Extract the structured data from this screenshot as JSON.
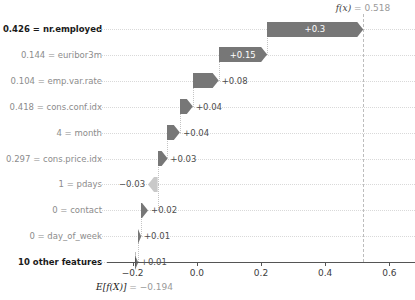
{
  "chart_data": {
    "type": "bar",
    "chart_style": "shap-waterfall",
    "title": "",
    "xlabel": "",
    "ylabel": "",
    "xlim": [
      -0.28,
      0.68
    ],
    "xticks": [
      -0.2,
      0.0,
      0.2,
      0.4,
      0.6
    ],
    "xticklabels": [
      "−0.2",
      "0.0",
      "0.2",
      "0.4",
      "0.6"
    ],
    "grid": true,
    "base_value": -0.194,
    "base_value_label": "−0.194",
    "output_value": 0.518,
    "output_value_label": "0.518",
    "base_annotation_prefix": "E[f(X)]",
    "base_annotation_eq": " = ",
    "output_annotation_prefix": "f(x)",
    "output_annotation_eq": " = ",
    "categories": [
      "0.426 = nr.employed",
      "0.144 = euribor3m",
      "0.104 = emp.var.rate",
      "0.418 = cons.conf.idx",
      "4 = month",
      "0.297 = cons.price.idx",
      "1 = pdays",
      "0 = contact",
      "0 = day_of_week",
      "10 other features"
    ],
    "values": [
      0.3,
      0.15,
      0.08,
      0.04,
      0.04,
      0.03,
      -0.03,
      0.02,
      0.01,
      0.01
    ],
    "value_labels": [
      "+0.3",
      "+0.15",
      "+0.08",
      "+0.04",
      "+0.04",
      "+0.03",
      "−0.03",
      "+0.02",
      "+0.01",
      "+0.01"
    ],
    "bars": [
      {
        "label": "0.426 = nr.employed",
        "value": 0.3,
        "value_label": "+0.3",
        "start": 0.218,
        "end": 0.518,
        "direction": "positive",
        "label_inside": true,
        "emphasis": true
      },
      {
        "label": "0.144 = euribor3m",
        "value": 0.15,
        "value_label": "+0.15",
        "start": 0.068,
        "end": 0.218,
        "direction": "positive",
        "label_inside": true,
        "emphasis": false
      },
      {
        "label": "0.104 = emp.var.rate",
        "value": 0.08,
        "value_label": "+0.08",
        "start": -0.012,
        "end": 0.068,
        "direction": "positive",
        "label_inside": false,
        "emphasis": false
      },
      {
        "label": "0.418 = cons.conf.idx",
        "value": 0.04,
        "value_label": "+0.04",
        "start": -0.052,
        "end": -0.012,
        "direction": "positive",
        "label_inside": false,
        "emphasis": false
      },
      {
        "label": "4 = month",
        "value": 0.04,
        "value_label": "+0.04",
        "start": -0.092,
        "end": -0.052,
        "direction": "positive",
        "label_inside": false,
        "emphasis": false
      },
      {
        "label": "0.297 = cons.price.idx",
        "value": 0.03,
        "value_label": "+0.03",
        "start": -0.122,
        "end": -0.092,
        "direction": "positive",
        "label_inside": false,
        "emphasis": false
      },
      {
        "label": "1 = pdays",
        "value": -0.03,
        "value_label": "−0.03",
        "start": -0.122,
        "end": -0.152,
        "direction": "negative",
        "label_inside": false,
        "emphasis": false
      },
      {
        "label": "0 = contact",
        "value": 0.02,
        "value_label": "+0.02",
        "start": -0.174,
        "end": -0.152,
        "direction": "positive",
        "label_inside": false,
        "emphasis": false
      },
      {
        "label": "0 = day_of_week",
        "value": 0.01,
        "value_label": "+0.01",
        "start": -0.184,
        "end": -0.174,
        "direction": "positive",
        "label_inside": false,
        "emphasis": false
      },
      {
        "label": "10 other features",
        "value": 0.01,
        "value_label": "+0.01",
        "start": -0.194,
        "end": -0.184,
        "direction": "positive",
        "label_inside": false,
        "emphasis": false
      }
    ],
    "colors": {
      "positive": "#777777",
      "negative": "#c9c9c9",
      "axis": "#555555",
      "grid": "#d9d9d9",
      "label": "#8c8c8c",
      "label_emphasis": "#1a1a1a",
      "annotation": "#9a9a9a",
      "value_inside": "#ffffff",
      "value_outside": "#4d4d4d"
    }
  }
}
